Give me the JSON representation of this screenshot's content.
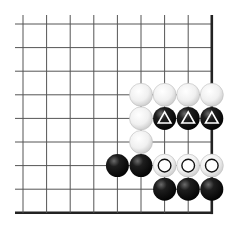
{
  "board": {
    "description": "Go problem diagram, lower-right corner",
    "columns": 9,
    "rows": 9,
    "origin_x": 23,
    "origin_y": 24,
    "spacing": 23.6,
    "line_extend_left": 15,
    "line_extend_top": 15,
    "edges": [
      "right",
      "bottom"
    ],
    "colors": {
      "line": "#555555",
      "edge": "#222222",
      "black_stone": "#111111",
      "white_stone": "#f4f4f4",
      "white_stone_stroke": "#bdbdbd"
    }
  },
  "stones": [
    {
      "col": 5,
      "row": 3,
      "color": "white",
      "mark": "none"
    },
    {
      "col": 6,
      "row": 3,
      "color": "white",
      "mark": "none"
    },
    {
      "col": 7,
      "row": 3,
      "color": "white",
      "mark": "none"
    },
    {
      "col": 8,
      "row": 3,
      "color": "white",
      "mark": "none"
    },
    {
      "col": 5,
      "row": 4,
      "color": "white",
      "mark": "none"
    },
    {
      "col": 6,
      "row": 4,
      "color": "black",
      "mark": "triangle"
    },
    {
      "col": 7,
      "row": 4,
      "color": "black",
      "mark": "triangle"
    },
    {
      "col": 8,
      "row": 4,
      "color": "black",
      "mark": "triangle"
    },
    {
      "col": 5,
      "row": 5,
      "color": "white",
      "mark": "none"
    },
    {
      "col": 4,
      "row": 6,
      "color": "black",
      "mark": "none"
    },
    {
      "col": 5,
      "row": 6,
      "color": "black",
      "mark": "none"
    },
    {
      "col": 6,
      "row": 6,
      "color": "white",
      "mark": "circle"
    },
    {
      "col": 7,
      "row": 6,
      "color": "white",
      "mark": "circle"
    },
    {
      "col": 8,
      "row": 6,
      "color": "white",
      "mark": "circle"
    },
    {
      "col": 6,
      "row": 7,
      "color": "black",
      "mark": "none"
    },
    {
      "col": 7,
      "row": 7,
      "color": "black",
      "mark": "none"
    },
    {
      "col": 8,
      "row": 7,
      "color": "black",
      "mark": "none"
    }
  ]
}
